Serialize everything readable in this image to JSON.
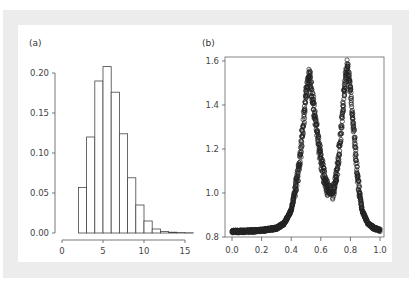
{
  "figure": {
    "panels": [
      "(a)",
      "(b)"
    ]
  },
  "chart_data": [
    {
      "type": "bar",
      "panel": "(a)",
      "title": "",
      "xlabel": "",
      "ylabel": "",
      "bin_edges": [
        2,
        3,
        4,
        5,
        6,
        7,
        8,
        9,
        10,
        11,
        12,
        13,
        14,
        15,
        16
      ],
      "values": [
        0.057,
        0.12,
        0.19,
        0.208,
        0.176,
        0.124,
        0.069,
        0.035,
        0.015,
        0.005,
        0.002,
        0.001,
        0.0005,
        0.0003
      ],
      "xlim": [
        0,
        16
      ],
      "ylim": [
        0,
        0.21
      ],
      "xticks": [
        "0",
        "5",
        "10",
        "15"
      ],
      "yticks": [
        "0.00",
        "0.05",
        "0.10",
        "0.15",
        "0.20"
      ],
      "grid": false
    },
    {
      "type": "scatter",
      "panel": "(b)",
      "title": "",
      "xlabel": "",
      "ylabel": "",
      "description": "Bimodal curve of open-circle markers; baseline ~0.82, peaks ~1.55 at x≈0.52 and ~1.58 at x≈0.78, valley ~1.0 at x≈0.67",
      "x": [
        0.0,
        0.1,
        0.2,
        0.3,
        0.35,
        0.4,
        0.45,
        0.48,
        0.5,
        0.52,
        0.54,
        0.57,
        0.6,
        0.63,
        0.66,
        0.68,
        0.7,
        0.72,
        0.74,
        0.76,
        0.78,
        0.8,
        0.82,
        0.85,
        0.88,
        0.92,
        0.96,
        1.0
      ],
      "y": [
        0.825,
        0.826,
        0.83,
        0.84,
        0.86,
        0.92,
        1.1,
        1.3,
        1.45,
        1.55,
        1.45,
        1.3,
        1.15,
        1.05,
        1.0,
        1.0,
        1.05,
        1.15,
        1.3,
        1.48,
        1.58,
        1.48,
        1.3,
        1.05,
        0.92,
        0.86,
        0.84,
        0.83
      ],
      "xlim": [
        0.0,
        1.0
      ],
      "ylim": [
        0.8,
        1.6
      ],
      "xticks": [
        "0.0",
        "0.2",
        "0.4",
        "0.6",
        "0.8",
        "1.0"
      ],
      "yticks": [
        "0.8",
        "1.0",
        "1.2",
        "1.4",
        "1.6"
      ],
      "grid": false
    }
  ]
}
